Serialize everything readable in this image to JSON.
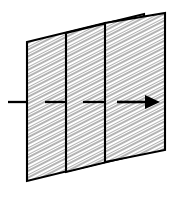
{
  "figure": {
    "canvas": {
      "width": 177,
      "height": 202,
      "background": "#ffffff"
    },
    "stroke_color": "#000000",
    "hatch_color": "#4a4a4a",
    "fill_color": "#ffffff"
  },
  "chart_data": {
    "type": "diagram",
    "planes": [
      {
        "name": "plane-1",
        "label": "front plane",
        "points": [
          [
            27,
            42
          ],
          [
            105,
            23
          ],
          [
            105,
            162
          ],
          [
            27,
            181
          ]
        ],
        "hatched": true
      },
      {
        "name": "plane-2",
        "label": "middle plane",
        "points": [
          [
            66,
            33
          ],
          [
            144,
            14
          ],
          [
            144,
            153
          ],
          [
            66,
            172
          ]
        ],
        "hatched": true
      },
      {
        "name": "plane-3",
        "label": "back plane",
        "points": [
          [
            105,
            23
          ],
          [
            165,
            13
          ],
          [
            165,
            150
          ],
          [
            105,
            162
          ]
        ],
        "hatched": true
      }
    ],
    "arrow": {
      "name": "transmitted-ray",
      "y": 102,
      "segments": [
        [
          8,
          27
        ],
        [
          45,
          65
        ],
        [
          83,
          105
        ],
        [
          117,
          149
        ]
      ],
      "head": {
        "tip_x": 160,
        "base_x": 145,
        "half_height": 7
      }
    },
    "hatch": {
      "angle_deg": -27,
      "spacing_px": 3.0,
      "direction": "lower-left to upper-right"
    }
  }
}
